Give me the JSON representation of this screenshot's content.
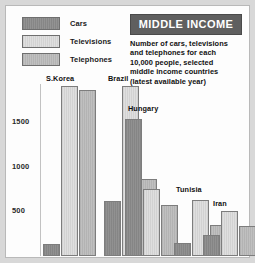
{
  "title": {
    "banner": "MIDDLE INCOME",
    "description_lines": [
      "Number of cars, televisions",
      "and telephones for each",
      "10,000 people, selected",
      "middle income countries",
      "(latest available year)"
    ]
  },
  "legend": {
    "items": [
      {
        "label": "Cars",
        "color": "#8d8d8d"
      },
      {
        "label": "Televisions",
        "color": "#dedede"
      },
      {
        "label": "Telephones",
        "color": "#bdbdbd"
      }
    ]
  },
  "axis": {
    "ticks": [
      "1500",
      "1000",
      "500"
    ]
  },
  "chart_data": {
    "type": "bar",
    "title": "MIDDLE INCOME",
    "subtitle": "Number of cars, televisions and telephones for each 10,000 people, selected middle income countries (latest available year)",
    "xlabel": "",
    "ylabel": "",
    "ylim": [
      0,
      1900
    ],
    "grid": false,
    "legend_position": "top-left",
    "categories": [
      "S.Korea",
      "Brazil",
      "Hungary",
      "Tunisia",
      "Iran"
    ],
    "series": [
      {
        "name": "Cars",
        "color": "#8d8d8d",
        "values": [
          130,
          610,
          1520,
          150,
          230
        ]
      },
      {
        "name": "Televisions",
        "color": "#dedede",
        "values": [
          1890,
          1890,
          740,
          620,
          500
        ]
      },
      {
        "name": "Telephones",
        "color": "#bdbdbd",
        "values": [
          1840,
          860,
          570,
          350,
          330
        ]
      }
    ]
  }
}
